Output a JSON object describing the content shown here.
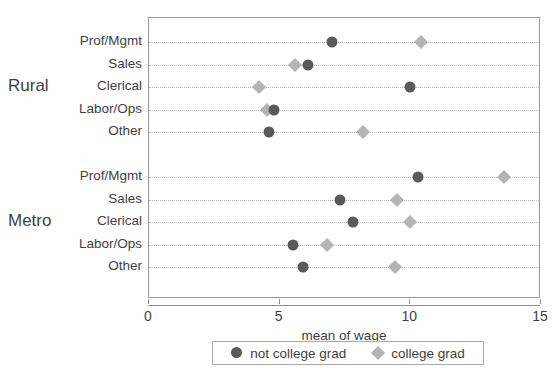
{
  "chart_data": {
    "type": "scatter",
    "title": "",
    "xlabel": "mean of wage",
    "ylabel": "",
    "xlim": [
      0,
      15
    ],
    "xticks": [
      0,
      5,
      10,
      15
    ],
    "xtick_labels": [
      "0",
      "5",
      "10",
      "15"
    ],
    "grid": true,
    "grid_style": "dotted-horizontal",
    "legend_position": "bottom",
    "orientation": "horizontal",
    "groups": [
      {
        "name": "Rural",
        "categories": [
          "Prof/Mgmt",
          "Sales",
          "Clerical",
          "Labor/Ops",
          "Other"
        ],
        "rows": [
          {
            "category": "Prof/Mgmt",
            "not_college_grad": 7.0,
            "college_grad": 10.4
          },
          {
            "category": "Sales",
            "not_college_grad": 6.1,
            "college_grad": 5.6
          },
          {
            "category": "Clerical",
            "not_college_grad": 10.0,
            "college_grad": 4.2
          },
          {
            "category": "Labor/Ops",
            "not_college_grad": 4.8,
            "college_grad": 4.5
          },
          {
            "category": "Other",
            "not_college_grad": 4.6,
            "college_grad": 8.2
          }
        ]
      },
      {
        "name": "Metro",
        "categories": [
          "Prof/Mgmt",
          "Sales",
          "Clerical",
          "Labor/Ops",
          "Other"
        ],
        "rows": [
          {
            "category": "Prof/Mgmt",
            "not_college_grad": 10.3,
            "college_grad": 13.6
          },
          {
            "category": "Sales",
            "not_college_grad": 7.3,
            "college_grad": 9.5
          },
          {
            "category": "Clerical",
            "not_college_grad": 7.8,
            "college_grad": 10.0
          },
          {
            "category": "Labor/Ops",
            "not_college_grad": 5.5,
            "college_grad": 6.8
          },
          {
            "category": "Other",
            "not_college_grad": 5.9,
            "college_grad": 9.4
          }
        ]
      }
    ],
    "series": [
      {
        "name": "not college grad",
        "marker": "circle",
        "color": "#5a5a5a"
      },
      {
        "name": "college grad",
        "marker": "diamond",
        "color": "#b4b4b4"
      }
    ]
  },
  "legend": {
    "entries": [
      {
        "label": "not college grad",
        "marker": "circle",
        "color": "#5a5a5a"
      },
      {
        "label": "college grad",
        "marker": "diamond",
        "color": "#b4b4b4"
      }
    ]
  },
  "axis": {
    "x_title": "mean of wage",
    "tick_labels": [
      "0",
      "5",
      "10",
      "15"
    ]
  },
  "colors": {
    "not_college_grad": "#5a5a5a",
    "college_grad": "#b4b4b4",
    "frame": "#9a9a9a",
    "gridline": "#b9b9b9",
    "text": "#3f3f3f",
    "background": "#ffffff"
  }
}
